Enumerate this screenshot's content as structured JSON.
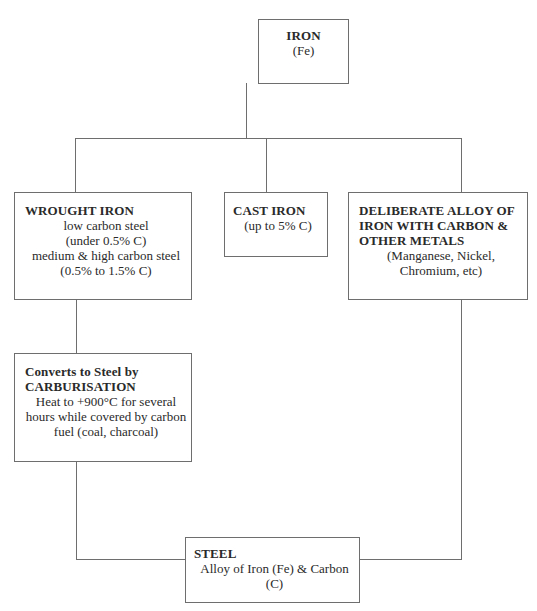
{
  "diagram": {
    "nodes": {
      "iron": {
        "title": "IRON",
        "lines": [
          "(Fe)"
        ]
      },
      "wrought_iron": {
        "title": "WROUGHT IRON",
        "lines": [
          "low carbon steel",
          "(under 0.5% C)",
          "medium & high carbon steel",
          "(0.5% to 1.5% C)"
        ]
      },
      "cast_iron": {
        "title": "CAST IRON",
        "lines": [
          "(up to 5% C)"
        ]
      },
      "deliberate_alloy": {
        "title_lines": [
          "DELIBERATE ALLOY OF",
          "IRON WITH CARBON &",
          "OTHER METALS"
        ],
        "lines": [
          "(Manganese, Nickel,",
          "Chromium, etc)"
        ]
      },
      "carburisation": {
        "title_lines": [
          "Converts to Steel by",
          "CARBURISATION"
        ],
        "lines": [
          "Heat to +900°C for several",
          "hours while covered by carbon",
          "fuel (coal, charcoal)"
        ]
      },
      "steel": {
        "title": "STEEL",
        "lines": [
          "Alloy of Iron (Fe) & Carbon",
          "(C)"
        ]
      }
    },
    "edges": [
      {
        "from": "iron",
        "to": "wrought_iron"
      },
      {
        "from": "iron",
        "to": "cast_iron"
      },
      {
        "from": "iron",
        "to": "deliberate_alloy"
      },
      {
        "from": "wrought_iron",
        "to": "carburisation"
      },
      {
        "from": "carburisation",
        "to": "steel"
      },
      {
        "from": "deliberate_alloy",
        "to": "steel"
      }
    ]
  }
}
